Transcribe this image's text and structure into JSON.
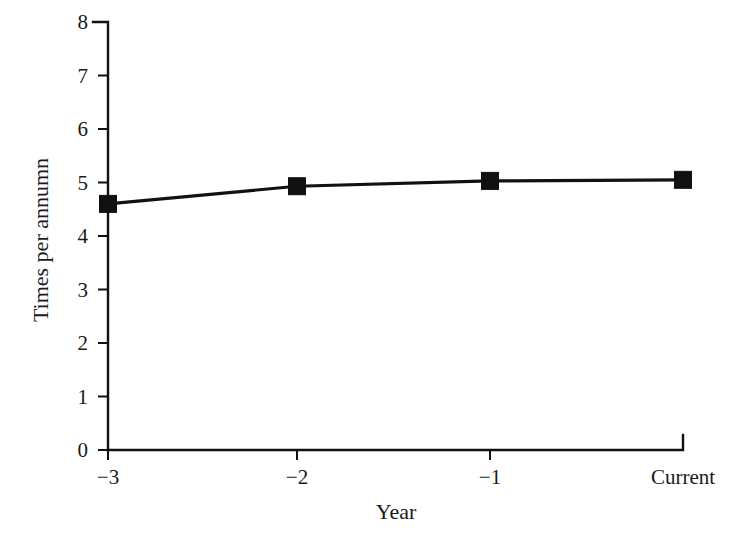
{
  "chart_data": {
    "type": "line",
    "title": "",
    "subtitle": "",
    "xlabel": "Year",
    "ylabel": "Times per annumn",
    "categories": [
      "-3",
      "-2",
      "-1",
      "Current"
    ],
    "x_tick_labels": [
      "−3",
      "−2",
      "−1",
      "Current"
    ],
    "y_tick_labels": [
      "0",
      "1",
      "2",
      "3",
      "4",
      "5",
      "6",
      "7",
      "8"
    ],
    "y_tick_values": [
      0,
      1,
      2,
      3,
      4,
      5,
      6,
      7,
      8
    ],
    "ylim": [
      0,
      8
    ],
    "values": [
      4.6,
      4.93,
      5.03,
      5.05
    ],
    "series": [
      {
        "name": "Times per annumn",
        "values": [
          4.6,
          4.93,
          5.03,
          5.05
        ],
        "marker": "square",
        "color": "#111111"
      }
    ],
    "grid": false,
    "legend": false,
    "legend_position": "none",
    "background_color": "#ffffff",
    "line_color": "#111111",
    "marker_color": "#111111"
  },
  "axes": {
    "x_title": "Year",
    "y_title": "Times per annumn"
  }
}
